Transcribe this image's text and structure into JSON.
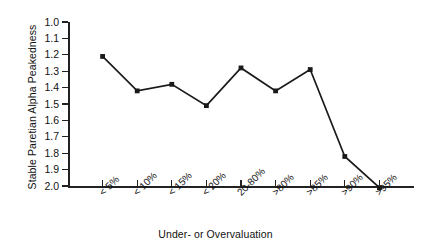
{
  "chart_data": {
    "type": "line",
    "title": "",
    "xlabel": "Under- or Overvaluation",
    "ylabel": "Stable Paretian Alpha Peakedness",
    "categories": [
      "< 5%",
      "< 10%",
      "< 15%",
      "< 20%",
      "20-80%",
      ">80%",
      ">85%",
      ">90%",
      ">95%"
    ],
    "values": [
      1.21,
      1.42,
      1.38,
      1.51,
      1.28,
      1.42,
      1.29,
      1.82,
      2.01
    ],
    "series": [
      {
        "name": "Stable Paretian Alpha Peakedness",
        "values": [
          1.21,
          1.42,
          1.38,
          1.51,
          1.28,
          1.42,
          1.29,
          1.82,
          2.01
        ]
      }
    ],
    "ylim": [
      1.0,
      2.0
    ],
    "y_inverted": true,
    "y_tick_labels": [
      "1.0",
      "1.1",
      "1.2",
      "1.3",
      "1.4",
      "1.5",
      "1.6",
      "1.7",
      "1.8",
      "1.9",
      "2.0"
    ],
    "grid": false,
    "legend": "none",
    "marker": "square",
    "line_color": "#1a1a1a",
    "marker_color": "#1a1a1a",
    "background_color": "#ffffff",
    "axis_color": "#222222"
  }
}
